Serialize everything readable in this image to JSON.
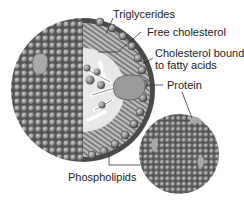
{
  "labels": {
    "triglycerides": "Triglycerides",
    "free_cholesterol": "Free cholesterol",
    "cholesterol_bound_line1": "Cholesterol bound",
    "cholesterol_bound_line2": "to fatty acids",
    "protein": "Protein",
    "phospholipids": "Phospholipids"
  },
  "colors": {
    "sphere": "#8a8a8a",
    "sphere_dark": "#4a4a4a",
    "sphere_light": "#c4c4c4",
    "protein": "#9a9a9a",
    "core": "#e8e8e8",
    "leader_line": "#333333",
    "text": "#222222",
    "background": "#ffffff"
  }
}
